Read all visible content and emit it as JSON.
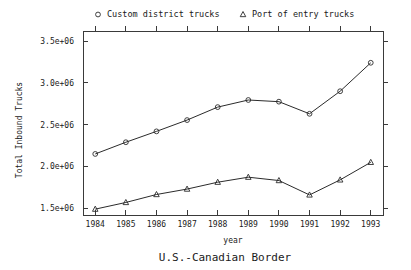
{
  "chart_data": {
    "type": "line",
    "title": "U.S.-Canadian Border",
    "xlabel": "year",
    "ylabel": "Total Inbound Trucks",
    "categories": [
      "1984",
      "1985",
      "1986",
      "1987",
      "1988",
      "1989",
      "1990",
      "1991",
      "1992",
      "1993"
    ],
    "x": [
      1984,
      1985,
      1986,
      1987,
      1988,
      1989,
      1990,
      1991,
      1992,
      1993
    ],
    "xlim": [
      1983.6,
      1993.4
    ],
    "ylim": [
      1420000,
      3620000
    ],
    "ytick_values": [
      1500000,
      2000000,
      2500000,
      3000000,
      3500000
    ],
    "ytick_labels": [
      "1.5e+06",
      "2.0e+06",
      "2.5e+06",
      "3.0e+06",
      "3.5e+06"
    ],
    "grid": false,
    "legend_position": "top",
    "series": [
      {
        "name": "Custom district trucks",
        "marker": "circle",
        "values": [
          2150000,
          2290000,
          2420000,
          2555000,
          2710000,
          2795000,
          2775000,
          2630000,
          2900000,
          3240000
        ]
      },
      {
        "name": "Port of entry trucks",
        "marker": "triangle",
        "values": [
          1490000,
          1570000,
          1665000,
          1730000,
          1812000,
          1872000,
          1832000,
          1660000,
          1840000,
          2050000
        ]
      }
    ]
  },
  "legend": {
    "entries": [
      {
        "label": "Custom district trucks",
        "marker": "circle"
      },
      {
        "label": "Port of entry trucks",
        "marker": "triangle"
      }
    ]
  },
  "colors": {
    "line": "#2b2b2b",
    "axis": "#3a3a3a",
    "text": "#1a1a1a",
    "background": "#ffffff"
  }
}
